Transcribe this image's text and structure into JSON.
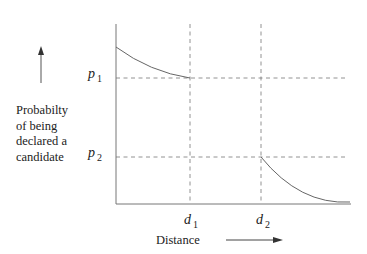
{
  "diagram": {
    "y_axis_label_lines": [
      "Probabilty",
      "of being",
      "declared a",
      "candidate"
    ],
    "x_axis_label": "Distance",
    "y_ticks": [
      {
        "symbol": "p",
        "sub": "1"
      },
      {
        "symbol": "p",
        "sub": "2"
      }
    ],
    "x_ticks": [
      {
        "symbol": "d",
        "sub": "1"
      },
      {
        "symbol": "d",
        "sub": "2"
      }
    ],
    "colors": {
      "line": "#777777",
      "text": "#222222"
    }
  }
}
